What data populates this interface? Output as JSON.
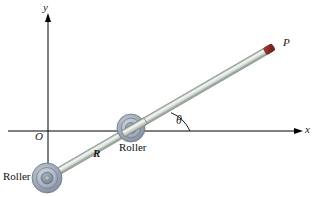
{
  "figure": {
    "width": 317,
    "height": 197,
    "background_color": "#ffffff"
  },
  "axes": {
    "x_label": "x",
    "y_label": "y",
    "origin_label": "O",
    "axis_color": "#000000",
    "origin_px": {
      "x": 48,
      "y": 131
    },
    "x_axis": {
      "x_start": 8,
      "x_end": 303,
      "y": 131
    },
    "y_axis": {
      "x": 48,
      "y_start": 13,
      "y_end": 193
    }
  },
  "rod": {
    "point_label": "P",
    "length_label": "R",
    "angle_label": "θ",
    "body_color": "#c9d1c9",
    "edge_color": "#8b958d",
    "tip_color": "#8b2a21",
    "start_px": {
      "x": 47,
      "y": 178
    },
    "end_px": {
      "x": 273,
      "y": 47
    }
  },
  "rollers": [
    {
      "label": "Roller",
      "position_name": "lower-left-on-y-axis",
      "center_px": {
        "x": 47,
        "y": 178
      },
      "radius_px": 15,
      "outer_color": "#9aa3b0",
      "mid_color": "#b8c0cc",
      "inner_color": "#7f8a99"
    },
    {
      "label": "Roller",
      "position_name": "on-x-axis",
      "center_px": {
        "x": 131,
        "y": 128
      },
      "radius_px": 14,
      "outer_color": "#9aa3b0",
      "mid_color": "#b8c0cc",
      "inner_color": "#7f8a99"
    }
  ],
  "angle_arc": {
    "label": "θ",
    "vertex_px": {
      "x": 190,
      "y": 131
    },
    "radius_px": 36,
    "color": "#1a1a1a"
  }
}
